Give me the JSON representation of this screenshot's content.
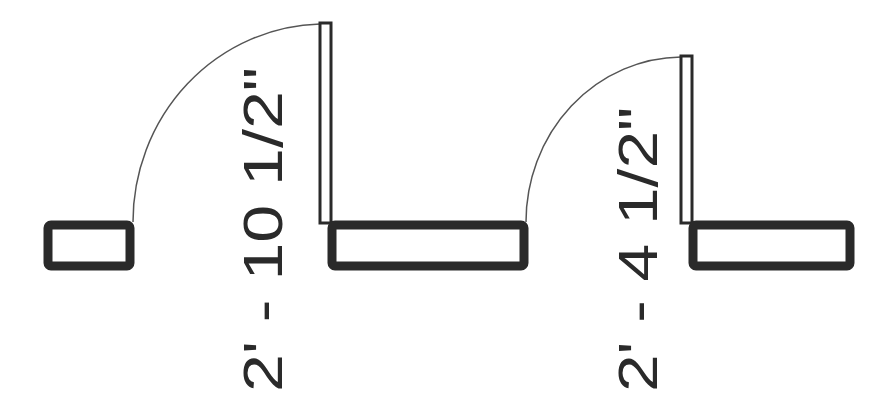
{
  "drawing": {
    "type": "floor-plan-door-openings",
    "colors": {
      "background": "#ffffff",
      "wall_stroke": "#2a2a2a",
      "door_stroke": "#2a2a2a",
      "swing_arc": "#555555",
      "text": "#2a2a2a"
    },
    "doors": [
      {
        "id": "door-1",
        "dimension_label": "2' - 10 1/2\"",
        "swing": "left-hinged-at-right-jamb"
      },
      {
        "id": "door-2",
        "dimension_label": "2' - 4 1/2\"",
        "swing": "left-hinged-at-right-jamb"
      }
    ],
    "walls": [
      {
        "id": "wall-left-stub"
      },
      {
        "id": "wall-middle"
      },
      {
        "id": "wall-right"
      }
    ]
  }
}
